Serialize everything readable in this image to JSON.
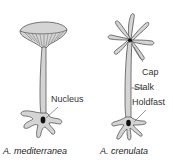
{
  "diagram": {
    "type": "biological-illustration",
    "organisms": [
      {
        "id": "mediterranea",
        "caption": "A. mediterranea",
        "cap_shape": "umbrella / disc-shaped cup",
        "labels": [
          {
            "text": "Nucleus",
            "points_to": "nucleus in holdfast"
          }
        ]
      },
      {
        "id": "crenulata",
        "caption": "A. crenulata",
        "cap_shape": "separated star-like rays",
        "labels": [
          {
            "text": "Cap",
            "points_to": "cap"
          },
          {
            "text": "Stalk",
            "points_to": "stalk"
          },
          {
            "text": "Holdfast",
            "points_to": "holdfast"
          }
        ]
      }
    ],
    "colors": {
      "fill": "#d4d4d4",
      "outline": "#555555",
      "nucleus": "#111111",
      "text": "#333333",
      "background": "#ffffff"
    }
  }
}
